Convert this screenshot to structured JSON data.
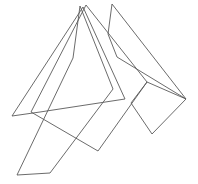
{
  "figure": {
    "type": "line-drawing",
    "background_color": "#ffffff",
    "stroke_color": "#5a5a5a",
    "stroke_width": 0.9,
    "canvas": {
      "width": 198,
      "height": 184
    },
    "shapes": [
      {
        "name": "tall-narrow-sliver-left",
        "description": "Very slender spike from top apex sweeping down to the bottom-left base",
        "closed": true,
        "points": "80,6 113,89 50,173 17,175 73,58"
      },
      {
        "name": "large-left-triangle-fan",
        "description": "Wide triangle with sharp left point reaching toward the left edge",
        "closed": true,
        "points": "83,7 12,116 40,112 125,99"
      },
      {
        "name": "central-sweeping-wedge",
        "description": "Broad wedge crossing the middle from upper area to lower-right V vertex",
        "closed": true,
        "points": "86,5 147,82 98,151 31,112"
      },
      {
        "name": "right-quadrilateral",
        "description": "Kite-like quadrilateral on the right side with concave notch at its left vertex",
        "closed": true,
        "points": "147,82 186,99 152,134 131,103"
      },
      {
        "name": "top-spike-to-right-diagonal",
        "description": "Thin spike at the top whose long diagonal descends to the rightmost vertex",
        "closed": true,
        "points": "112,4 186,99 117,57 108,34"
      }
    ]
  }
}
